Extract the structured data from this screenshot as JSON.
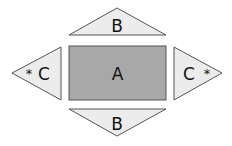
{
  "diagram": {
    "center": {
      "label": "A",
      "fill": "#a8a8a8",
      "stroke": "#555555"
    },
    "top": {
      "label": "B",
      "fill": "#ececec",
      "stroke": "#555555"
    },
    "bottom": {
      "label": "B",
      "fill": "#ececec",
      "stroke": "#555555"
    },
    "left": {
      "label": "C",
      "marker": "*",
      "fill": "#ececec",
      "stroke": "#555555"
    },
    "right": {
      "label": "C",
      "marker": "*",
      "fill": "#ececec",
      "stroke": "#555555"
    }
  }
}
